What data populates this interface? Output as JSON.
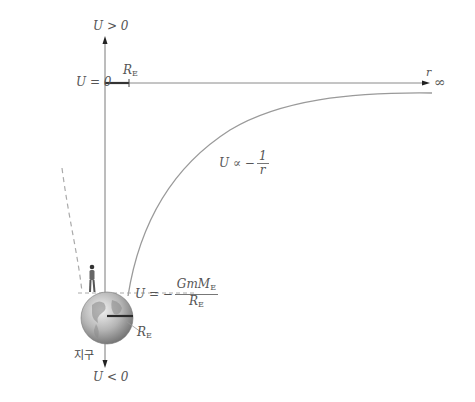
{
  "diagram": {
    "axes": {
      "y_top_label": "U > 0",
      "y_bottom_label": "U < 0",
      "zero_label": "U = 0",
      "x_axis_var": "r",
      "x_infinity": "∞"
    },
    "radius_marker": {
      "top": {
        "symbol": "R",
        "subscript": "E"
      },
      "earth": {
        "symbol": "R",
        "subscript": "E"
      }
    },
    "curve_label": {
      "prefix": "U ∝ −",
      "numerator": "1",
      "denominator": "r"
    },
    "surface_potential": {
      "prefix": "U = −",
      "numerator": "GmM",
      "numerator_sub": "E",
      "denominator": "R",
      "denominator_sub": "E"
    },
    "earth_label": "지구",
    "colors": {
      "axis": "#7a7a7a",
      "curve": "#9a9a9a",
      "dashed": "#aaaaaa",
      "marker": "#333333",
      "earth": "#b8b8b8"
    }
  }
}
